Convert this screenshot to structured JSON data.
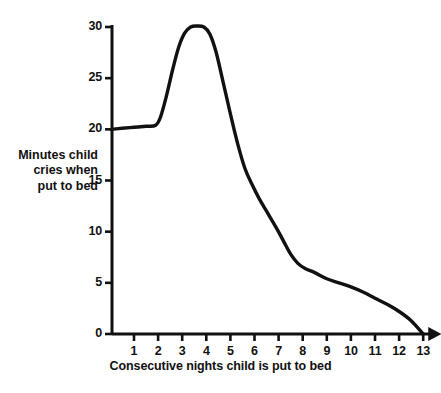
{
  "chart_data": {
    "type": "line",
    "title": "",
    "xlabel": "Consecutive nights child is put to bed",
    "ylabel": "Minutes child\ncries when\nput to bed",
    "ylabel_lines": [
      "Minutes child",
      "cries when",
      "put to bed"
    ],
    "xlim": [
      0,
      13.5
    ],
    "ylim": [
      0,
      30
    ],
    "xticks": [
      1,
      2,
      3,
      4,
      5,
      6,
      7,
      8,
      9,
      10,
      11,
      12,
      13
    ],
    "xtick_labels": [
      "1",
      "2",
      "3",
      "4",
      "5",
      "6",
      "7",
      "8",
      "9",
      "10",
      "11",
      "12",
      "13"
    ],
    "yticks": [
      0,
      5,
      10,
      15,
      20,
      25,
      30
    ],
    "ytick_labels": [
      "0",
      "5",
      "10",
      "15",
      "20",
      "25",
      "30"
    ],
    "grid": false,
    "legend": "none",
    "line_color": "#111111",
    "axis_color": "#111111",
    "series": [
      {
        "name": "Minutes child cries when put to bed",
        "x": [
          0.05,
          0.5,
          1.0,
          1.5,
          1.9,
          2.1,
          2.35,
          2.6,
          2.85,
          3.1,
          3.35,
          3.6,
          3.9,
          4.15,
          4.4,
          4.7,
          5.0,
          5.3,
          5.6,
          5.9,
          6.2,
          6.5,
          6.9,
          7.2,
          7.5,
          7.8,
          8.1,
          8.5,
          9.0,
          9.5,
          10.0,
          10.5,
          11.0,
          11.5,
          12.0,
          12.5,
          13.0
        ],
        "y": [
          20.0,
          20.1,
          20.2,
          20.3,
          20.4,
          21.2,
          23.3,
          25.8,
          28.0,
          29.4,
          30.0,
          30.1,
          30.0,
          29.3,
          27.6,
          24.6,
          21.5,
          18.6,
          16.2,
          14.6,
          13.2,
          12.0,
          10.4,
          9.1,
          7.8,
          6.9,
          6.4,
          6.0,
          5.4,
          5.0,
          4.6,
          4.1,
          3.5,
          2.9,
          2.2,
          1.3,
          0.0
        ]
      }
    ]
  },
  "axes_geometry": {
    "origin_x": 112,
    "origin_y": 334,
    "top_y": 27,
    "x_tick_start": 134,
    "x_tick_spacing": 24.1
  }
}
